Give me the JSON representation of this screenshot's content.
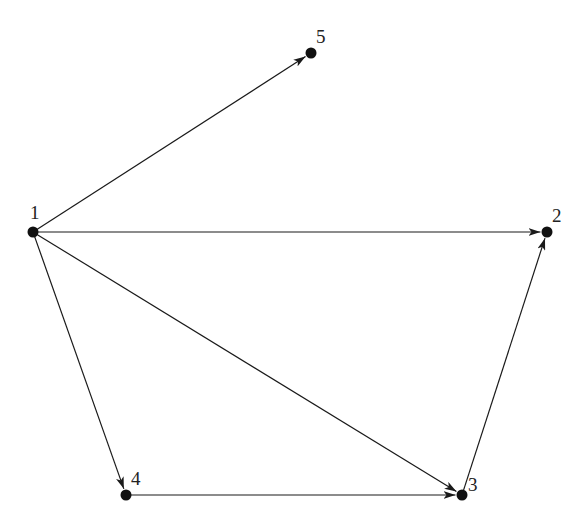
{
  "diagram": {
    "type": "directed-graph",
    "colors": {
      "stroke": "#1a1a1a",
      "node": "#111111",
      "label": "#222222",
      "background": "#ffffff"
    },
    "nodes": [
      {
        "id": "1",
        "label": "1",
        "x": 33,
        "y": 232,
        "lx": 30,
        "ly": 219
      },
      {
        "id": "2",
        "label": "2",
        "x": 547,
        "y": 232,
        "lx": 552,
        "ly": 222
      },
      {
        "id": "3",
        "label": "3",
        "x": 462,
        "y": 495,
        "lx": 468,
        "ly": 491
      },
      {
        "id": "4",
        "label": "4",
        "x": 126,
        "y": 495,
        "lx": 131,
        "ly": 485
      },
      {
        "id": "5",
        "label": "5",
        "x": 311,
        "y": 53,
        "lx": 316,
        "ly": 43
      }
    ],
    "edges": [
      {
        "from": "1",
        "to": "5"
      },
      {
        "from": "1",
        "to": "2"
      },
      {
        "from": "1",
        "to": "3"
      },
      {
        "from": "1",
        "to": "4"
      },
      {
        "from": "4",
        "to": "3"
      },
      {
        "from": "3",
        "to": "2"
      }
    ]
  }
}
